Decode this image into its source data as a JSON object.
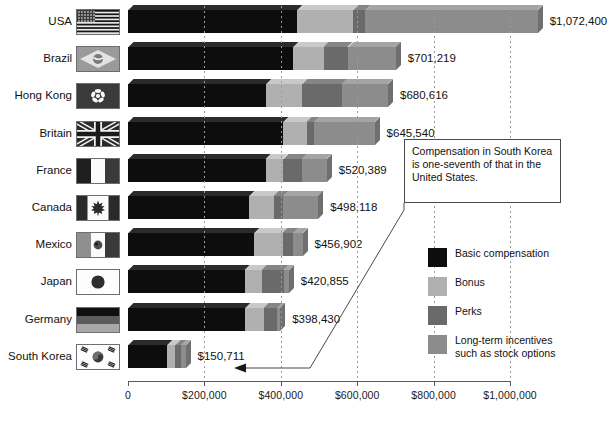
{
  "chart_data": {
    "type": "bar",
    "orientation": "horizontal",
    "stacked": true,
    "title": "",
    "xlabel": "",
    "ylabel": "",
    "xlim": [
      0,
      1000000
    ],
    "grid": true,
    "legend_position": "right",
    "xticks": [
      {
        "value": 0,
        "label": "0"
      },
      {
        "value": 200000,
        "label": "$200,000"
      },
      {
        "value": 400000,
        "label": "$400,000"
      },
      {
        "value": 600000,
        "label": "$600,000"
      },
      {
        "value": 800000,
        "label": "$800,000"
      },
      {
        "value": 1000000,
        "label": "$1,000,000"
      }
    ],
    "series": [
      {
        "name": "Basic compensation",
        "key": "basic",
        "color": "#0d0d0d"
      },
      {
        "name": "Bonus",
        "key": "bonus",
        "color": "#b0b0b0"
      },
      {
        "name": "Perks",
        "key": "perks",
        "color": "#6a6a6a"
      },
      {
        "name": "Long-term incentives such as stock options",
        "key": "lti",
        "color": "#8c8c8c"
      }
    ],
    "categories": [
      "USA",
      "Brazil",
      "Hong Kong",
      "Britain",
      "France",
      "Canada",
      "Mexico",
      "Japan",
      "Germany",
      "South Korea"
    ],
    "rows": [
      {
        "country": "USA",
        "flag": "flag-usa",
        "total": 1072400,
        "total_label": "$1,072,400",
        "basic": 443000,
        "bonus": 147000,
        "perks": 31000,
        "lti": 451400
      },
      {
        "country": "Brazil",
        "flag": "flag-brazil",
        "total": 701219,
        "total_label": "$701,219",
        "basic": 432000,
        "bonus": 81000,
        "perks": 63000,
        "lti": 125219
      },
      {
        "country": "Hong Kong",
        "flag": "flag-hongkong",
        "total": 680616,
        "total_label": "$680,616",
        "basic": 362000,
        "bonus": 94000,
        "perks": 104000,
        "lti": 120616
      },
      {
        "country": "Britain",
        "flag": "flag-britain",
        "total": 645540,
        "total_label": "$645,540",
        "basic": 406000,
        "bonus": 62000,
        "perks": 20000,
        "lti": 157540
      },
      {
        "country": "France",
        "flag": "flag-france",
        "total": 520389,
        "total_label": "$520,389",
        "basic": 361000,
        "bonus": 45000,
        "perks": 49000,
        "lti": 65389
      },
      {
        "country": "Canada",
        "flag": "flag-canada",
        "total": 498118,
        "total_label": "$498,118",
        "basic": 317000,
        "bonus": 64000,
        "perks": 25000,
        "lti": 92118
      },
      {
        "country": "Mexico",
        "flag": "flag-mexico",
        "total": 456902,
        "total_label": "$456,902",
        "basic": 330000,
        "bonus": 75000,
        "perks": 28000,
        "lti": 23902
      },
      {
        "country": "Japan",
        "flag": "flag-japan",
        "total": 420855,
        "total_label": "$420,855",
        "basic": 305000,
        "bonus": 45000,
        "perks": 58000,
        "lti": 12855
      },
      {
        "country": "Germany",
        "flag": "flag-germany",
        "total": 398430,
        "total_label": "$398,430",
        "basic": 307000,
        "bonus": 48000,
        "perks": 36000,
        "lti": 7430
      },
      {
        "country": "South Korea",
        "flag": "flag-southkorea",
        "total": 150711,
        "total_label": "$150,711",
        "basic": 103000,
        "bonus": 21000,
        "perks": 15000,
        "lti": 11711
      }
    ]
  },
  "legend": {
    "items": [
      {
        "label": "Basic compensation",
        "color": "#0d0d0d",
        "name": "legend-basic"
      },
      {
        "label": "Bonus",
        "color": "#b0b0b0",
        "name": "legend-bonus"
      },
      {
        "label": "Perks",
        "color": "#6a6a6a",
        "name": "legend-perks"
      },
      {
        "label": "Long-term incentives such as stock options",
        "color": "#8c8c8c",
        "name": "legend-lti"
      }
    ]
  },
  "callout": {
    "text": "Compensation in South Korea is one-seventh of that in the United States."
  }
}
